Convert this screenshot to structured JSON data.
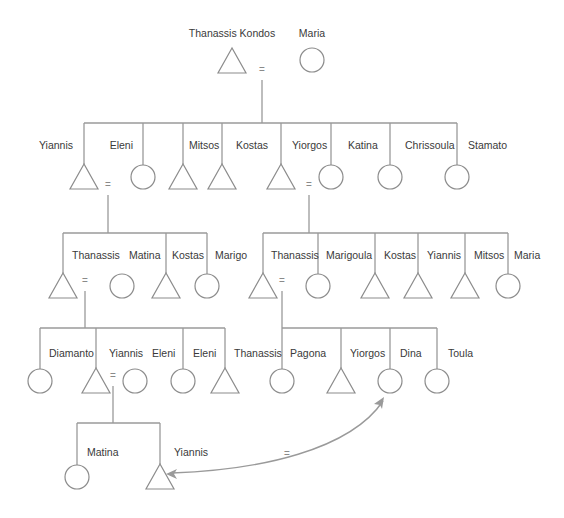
{
  "diagram": {
    "type": "kinship-chart",
    "colors": {
      "line": "#9a9a9a",
      "shape_stroke": "#8c8c8c",
      "label": "#3a3a3a"
    },
    "marriage_symbol": "=",
    "generations": [
      {
        "name": "generation-1",
        "people": [
          {
            "id": "thanassis-kondos",
            "name": "Thanassis Kondos",
            "sex": "male",
            "x": 232,
            "y": 61,
            "label_x": 232,
            "label_y": 37,
            "anchor": "middle"
          },
          {
            "id": "maria-1",
            "name": "Maria",
            "sex": "female",
            "x": 312,
            "y": 60,
            "label_x": 312,
            "label_y": 37,
            "anchor": "middle"
          }
        ],
        "marriages": [
          {
            "x": 262,
            "y": 73
          }
        ]
      },
      {
        "name": "generation-2",
        "people": [
          {
            "id": "yiannis-2",
            "name": "Yiannis",
            "sex": "male",
            "x": 84,
            "y": 177,
            "label_x": 73,
            "label_y": 149,
            "anchor": "end"
          },
          {
            "id": "eleni-2",
            "name": "Eleni",
            "sex": "female",
            "x": 143,
            "y": 177,
            "label_x": 133,
            "label_y": 149,
            "anchor": "end"
          },
          {
            "id": "mitsos-2",
            "name": "Mitsos",
            "sex": "male",
            "x": 183,
            "y": 177,
            "label_x": 189,
            "label_y": 149,
            "anchor": "start"
          },
          {
            "id": "kostas-2",
            "name": "Kostas",
            "sex": "male",
            "x": 222,
            "y": 177,
            "label_x": 236,
            "label_y": 149,
            "anchor": "start"
          },
          {
            "id": "yiorgos-2",
            "name": "Yiorgos",
            "sex": "male",
            "x": 281,
            "y": 177,
            "label_x": 292,
            "label_y": 149,
            "anchor": "start"
          },
          {
            "id": "katina-2",
            "name": "Katina",
            "sex": "female",
            "x": 331,
            "y": 177,
            "label_x": 348,
            "label_y": 149,
            "anchor": "start"
          },
          {
            "id": "chrissoula-2",
            "name": "Chrissoula",
            "sex": "female",
            "x": 390,
            "y": 177,
            "label_x": 405,
            "label_y": 149,
            "anchor": "start"
          },
          {
            "id": "stamato-2",
            "name": "Stamato",
            "sex": "female",
            "x": 457,
            "y": 177,
            "label_x": 468,
            "label_y": 149,
            "anchor": "start"
          }
        ],
        "marriages": [
          {
            "x": 108,
            "y": 188
          },
          {
            "x": 309,
            "y": 188
          }
        ]
      },
      {
        "name": "generation-3",
        "people": [
          {
            "id": "thanassis-3a",
            "name": "Thanassis",
            "sex": "male",
            "x": 63,
            "y": 286,
            "label_x": 72,
            "label_y": 259,
            "anchor": "start"
          },
          {
            "id": "matina-3",
            "name": "Matina",
            "sex": "female",
            "x": 122,
            "y": 286,
            "label_x": 129,
            "label_y": 259,
            "anchor": "start"
          },
          {
            "id": "kostas-3a",
            "name": "Kostas",
            "sex": "male",
            "x": 166,
            "y": 286,
            "label_x": 172,
            "label_y": 259,
            "anchor": "start"
          },
          {
            "id": "marigo-3",
            "name": "Marigo",
            "sex": "female",
            "x": 207,
            "y": 286,
            "label_x": 215,
            "label_y": 259,
            "anchor": "start"
          },
          {
            "id": "thanassis-3b",
            "name": "Thanassis",
            "sex": "male",
            "x": 263,
            "y": 286,
            "label_x": 271,
            "label_y": 259,
            "anchor": "start"
          },
          {
            "id": "marigoula-3",
            "name": "Marigoula",
            "sex": "female",
            "x": 318,
            "y": 286,
            "label_x": 326,
            "label_y": 259,
            "anchor": "start"
          },
          {
            "id": "kostas-3b",
            "name": "Kostas",
            "sex": "male",
            "x": 375,
            "y": 286,
            "label_x": 384,
            "label_y": 259,
            "anchor": "start"
          },
          {
            "id": "yiannis-3",
            "name": "Yiannis",
            "sex": "male",
            "x": 418,
            "y": 286,
            "label_x": 427,
            "label_y": 259,
            "anchor": "start"
          },
          {
            "id": "mitsos-3",
            "name": "Mitsos",
            "sex": "male",
            "x": 465,
            "y": 286,
            "label_x": 474,
            "label_y": 259,
            "anchor": "start"
          },
          {
            "id": "maria-3",
            "name": "Maria",
            "sex": "female",
            "x": 508,
            "y": 286,
            "label_x": 514,
            "label_y": 259,
            "anchor": "start"
          }
        ],
        "marriages": [
          {
            "x": 85,
            "y": 284
          },
          {
            "x": 282,
            "y": 284
          }
        ]
      },
      {
        "name": "generation-4",
        "people": [
          {
            "id": "diamanto-4",
            "name": "Diamanto",
            "sex": "female",
            "x": 40,
            "y": 381,
            "label_x": 49,
            "label_y": 357,
            "anchor": "start"
          },
          {
            "id": "yiannis-4",
            "name": "Yiannis",
            "sex": "male",
            "x": 96,
            "y": 381,
            "label_x": 109,
            "label_y": 357,
            "anchor": "start"
          },
          {
            "id": "eleni-4a",
            "name": "Eleni",
            "sex": "female",
            "x": 135,
            "y": 381,
            "label_x": 152,
            "label_y": 357,
            "anchor": "start"
          },
          {
            "id": "eleni-4b",
            "name": "Eleni",
            "sex": "female",
            "x": 183,
            "y": 381,
            "label_x": 193,
            "label_y": 357,
            "anchor": "start"
          },
          {
            "id": "thanassis-4",
            "name": "Thanassis",
            "sex": "male",
            "x": 225,
            "y": 381,
            "label_x": 234,
            "label_y": 357,
            "anchor": "start"
          },
          {
            "id": "pagona-4",
            "name": "Pagona",
            "sex": "female",
            "x": 282,
            "y": 381,
            "label_x": 290,
            "label_y": 357,
            "anchor": "start"
          },
          {
            "id": "yiorgos-4",
            "name": "Yiorgos",
            "sex": "male",
            "x": 341,
            "y": 381,
            "label_x": 350,
            "label_y": 357,
            "anchor": "start"
          },
          {
            "id": "dina-4",
            "name": "Dina",
            "sex": "female",
            "x": 390,
            "y": 381,
            "label_x": 400,
            "label_y": 357,
            "anchor": "start"
          },
          {
            "id": "toula-4",
            "name": "Toula",
            "sex": "female",
            "x": 437,
            "y": 381,
            "label_x": 448,
            "label_y": 357,
            "anchor": "start"
          }
        ],
        "marriages": [
          {
            "x": 113,
            "y": 379
          }
        ]
      },
      {
        "name": "generation-5",
        "people": [
          {
            "id": "matina-5",
            "name": "Matina",
            "sex": "female",
            "x": 77,
            "y": 477,
            "label_x": 87,
            "label_y": 456,
            "anchor": "start"
          },
          {
            "id": "yiannis-5",
            "name": "Yiannis",
            "sex": "male",
            "x": 160,
            "y": 477,
            "label_x": 174,
            "label_y": 456,
            "anchor": "start"
          }
        ],
        "marriages": [
          {
            "x": 287,
            "y": 457
          }
        ]
      }
    ],
    "lines": [
      {
        "d": "M262 80 L262 123"
      },
      {
        "d": "M84 123 L457 123"
      },
      {
        "d": "M84 123 L84 164"
      },
      {
        "d": "M143 123 L143 165"
      },
      {
        "d": "M183 123 L183 164"
      },
      {
        "d": "M222 123 L222 164"
      },
      {
        "d": "M281 123 L281 164"
      },
      {
        "d": "M331 123 L331 165"
      },
      {
        "d": "M390 123 L390 165"
      },
      {
        "d": "M457 123 L457 165"
      },
      {
        "d": "M108 195 L108 233"
      },
      {
        "d": "M63 233 L207 233"
      },
      {
        "d": "M63 233 L63 273"
      },
      {
        "d": "M166 233 L166 273"
      },
      {
        "d": "M207 233 L207 274"
      },
      {
        "d": "M309 195 L309 233"
      },
      {
        "d": "M263 233 L508 233"
      },
      {
        "d": "M263 233 L263 273"
      },
      {
        "d": "M318 233 L318 274"
      },
      {
        "d": "M375 233 L375 273"
      },
      {
        "d": "M418 233 L418 273"
      },
      {
        "d": "M465 233 L465 273"
      },
      {
        "d": "M508 233 L508 274"
      },
      {
        "d": "M85 291 L85 328"
      },
      {
        "d": "M40 328 L225 328"
      },
      {
        "d": "M40 328 L40 369"
      },
      {
        "d": "M96 328 L96 368"
      },
      {
        "d": "M183 328 L183 369"
      },
      {
        "d": "M225 328 L225 368"
      },
      {
        "d": "M282 291 L282 328"
      },
      {
        "d": "M282 328 L437 328"
      },
      {
        "d": "M282 328 L282 369"
      },
      {
        "d": "M341 328 L341 368"
      },
      {
        "d": "M390 328 L390 369"
      },
      {
        "d": "M437 328 L437 369"
      },
      {
        "d": "M113 386 L113 423"
      },
      {
        "d": "M77 423 L160 423"
      },
      {
        "d": "M77 423 L77 465"
      },
      {
        "d": "M160 423 L160 464"
      }
    ],
    "marriage_link": {
      "from": "dina-4",
      "to": "yiannis-5",
      "path": "M172 473 C 260 470, 350 450, 383 401",
      "head_to": {
        "x": 166,
        "y": 474
      },
      "head_from": {
        "x": 384,
        "y": 397
      }
    }
  }
}
